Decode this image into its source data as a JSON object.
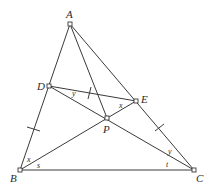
{
  "diagram": {
    "type": "geometry",
    "points": {
      "A": "A",
      "B": "B",
      "C": "C",
      "D": "D",
      "E": "E",
      "P": "P"
    },
    "segments": [
      "AB",
      "AC",
      "BC",
      "AP",
      "DE",
      "DC",
      "BE"
    ],
    "angle_labels": {
      "DBP": "x",
      "PBC": "s",
      "EDP": "y",
      "DEP": "x",
      "ECP": "y",
      "PCB": "t"
    },
    "equal_marks": [
      "BD",
      "CE",
      "DE-near-AP"
    ]
  }
}
